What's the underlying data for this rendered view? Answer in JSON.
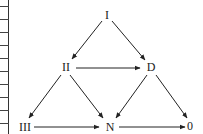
{
  "diagram": {
    "type": "directed-graph",
    "nodes": [
      {
        "id": "I",
        "label": "I",
        "x": 107,
        "y": 15
      },
      {
        "id": "II",
        "label": "II",
        "x": 66,
        "y": 67
      },
      {
        "id": "D",
        "label": "D",
        "x": 151,
        "y": 67
      },
      {
        "id": "III",
        "label": "III",
        "x": 25,
        "y": 127
      },
      {
        "id": "N",
        "label": "N",
        "x": 110,
        "y": 127
      },
      {
        "id": "0",
        "label": "0",
        "x": 190,
        "y": 126
      }
    ],
    "edges": [
      {
        "from": "I",
        "to": "II"
      },
      {
        "from": "I",
        "to": "D"
      },
      {
        "from": "II",
        "to": "D"
      },
      {
        "from": "II",
        "to": "III"
      },
      {
        "from": "II",
        "to": "N"
      },
      {
        "from": "D",
        "to": "N"
      },
      {
        "from": "D",
        "to": "0"
      },
      {
        "from": "III",
        "to": "N"
      },
      {
        "from": "N",
        "to": "0"
      }
    ],
    "colors": {
      "line": "#222222",
      "text": "#222222"
    }
  },
  "ruler": {
    "ticks": [
      6,
      19,
      32,
      45,
      58,
      71,
      84,
      97,
      110,
      123
    ]
  }
}
